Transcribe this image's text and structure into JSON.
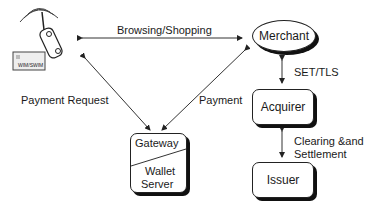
{
  "nodes": {
    "mobile_device": {
      "card_label": "WIM/SWIM"
    },
    "merchant": {
      "label": "Merchant"
    },
    "acquirer": {
      "label": "Acquirer"
    },
    "issuer": {
      "label": "Issuer"
    },
    "gateway": {
      "top_label": "Gateway",
      "bottom_label_line1": "Wallet",
      "bottom_label_line2": "Server"
    }
  },
  "edges": {
    "browsing": {
      "label": "Browsing/Shopping"
    },
    "payment_request": {
      "label": "Payment Request"
    },
    "payment": {
      "label": "Payment"
    },
    "set_tls": {
      "label": "SET/TLS"
    },
    "clearing_line1": {
      "label": "Clearing &and"
    },
    "clearing_line2": {
      "label": "Settlement"
    }
  }
}
